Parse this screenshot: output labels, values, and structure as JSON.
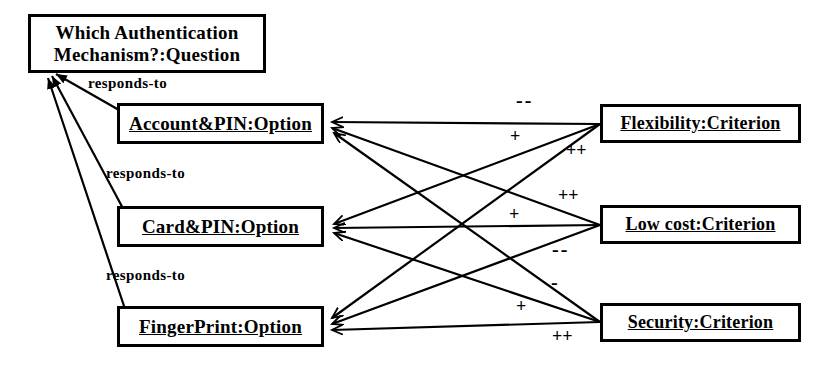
{
  "diagram": {
    "title_nodes": {
      "question": {
        "label": "Which Authentication Mechanism?:Question",
        "line1": "Which Authentication",
        "line2": "Mechanism?:Question"
      }
    },
    "options": [
      {
        "id": "account-pin",
        "label": "Account&PIN:Option"
      },
      {
        "id": "card-pin",
        "label": "Card&PIN:Option"
      },
      {
        "id": "fingerprint",
        "label": "FingerPrint:Option"
      }
    ],
    "criteria": [
      {
        "id": "flexibility",
        "label": "Flexibility:Criterion"
      },
      {
        "id": "lowcost",
        "label": "Low cost:Criterion"
      },
      {
        "id": "security",
        "label": "Security:Criterion"
      }
    ],
    "association_labels": [
      {
        "id": "responds-to-1",
        "text": "responds-to"
      },
      {
        "id": "responds-to-2",
        "text": "responds-to"
      },
      {
        "id": "responds-to-3",
        "text": "responds-to"
      }
    ],
    "contribution_labels": [
      {
        "id": "flex-to-account",
        "text": "--",
        "from": "flexibility",
        "to": "account-pin"
      },
      {
        "id": "flex-to-card",
        "text": "+",
        "from": "flexibility",
        "to": "card-pin"
      },
      {
        "id": "flex-to-finger",
        "text": "++",
        "from": "flexibility",
        "to": "fingerprint"
      },
      {
        "id": "lowcost-to-account",
        "text": "++",
        "from": "lowcost",
        "to": "account-pin"
      },
      {
        "id": "lowcost-to-card",
        "text": "+",
        "from": "lowcost",
        "to": "card-pin"
      },
      {
        "id": "lowcost-to-finger",
        "text": "--",
        "from": "lowcost",
        "to": "fingerprint"
      },
      {
        "id": "security-to-account",
        "text": "-",
        "from": "security",
        "to": "account-pin"
      },
      {
        "id": "security-to-card",
        "text": "+",
        "from": "security",
        "to": "card-pin"
      },
      {
        "id": "security-to-finger",
        "text": "++",
        "from": "security",
        "to": "fingerprint"
      }
    ],
    "colors": {
      "stroke": "#000000",
      "fill": "#ffffff",
      "text": "#000000"
    }
  }
}
